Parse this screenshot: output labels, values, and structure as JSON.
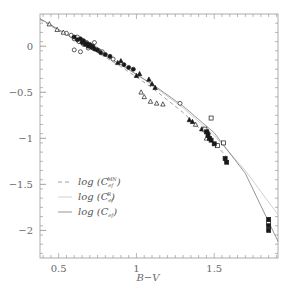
{
  "chart_data": {
    "type": "scatter",
    "title": "",
    "xlabel": "B−V",
    "ylabel": "",
    "xlim": [
      0.38,
      1.91
    ],
    "ylim": [
      -2.3,
      0.35
    ],
    "grid": false,
    "legend_position": "lower left",
    "x_ticks": [
      0.5,
      1,
      1.5
    ],
    "x_tick_labels": [
      "0.5",
      "1",
      "1.5"
    ],
    "y_ticks": [
      0,
      -0.5,
      -1,
      -1.5,
      -2
    ],
    "y_tick_labels": [
      "0",
      "−0.5",
      "−1",
      "−1.5",
      "−2"
    ],
    "legend": [
      {
        "label": "log",
        "symbol": "C",
        "sup": "MN",
        "sub": "ef",
        "style": "dashed",
        "color": "#888888"
      },
      {
        "label": "log",
        "symbol": "C",
        "sup": "R",
        "sub": "ef",
        "style": "solid-light",
        "color": "#c0c0c0"
      },
      {
        "label": "log",
        "symbol": "C",
        "sup": "",
        "sub": "ef",
        "style": "solid",
        "color": "#555555"
      }
    ],
    "series": [
      {
        "name": "log(C_ef^MN)",
        "kind": "line",
        "style": "dashed",
        "x": [
          0.38,
          0.5,
          0.7,
          0.9,
          1.1,
          1.3,
          1.5,
          1.6
        ],
        "y": [
          0.29,
          0.17,
          -0.02,
          -0.22,
          -0.45,
          -0.72,
          -1.05,
          -1.24
        ]
      },
      {
        "name": "log(C_ef^R)",
        "kind": "line",
        "style": "solid-light",
        "x": [
          0.38,
          0.5,
          0.7,
          0.9,
          1.1,
          1.3,
          1.5,
          1.7,
          1.91
        ],
        "y": [
          0.3,
          0.18,
          -0.01,
          -0.2,
          -0.42,
          -0.67,
          -0.97,
          -1.35,
          -1.83
        ]
      },
      {
        "name": "log(C_ef)",
        "kind": "line",
        "style": "solid",
        "x": [
          0.38,
          0.5,
          0.7,
          0.9,
          1.1,
          1.3,
          1.5,
          1.7,
          1.91
        ],
        "y": [
          0.3,
          0.18,
          -0.01,
          -0.2,
          -0.41,
          -0.65,
          -0.94,
          -1.38,
          -2.12
        ]
      },
      {
        "name": "open circles",
        "kind": "points",
        "marker": "circle-open",
        "x": [
          0.55,
          0.58,
          0.6,
          0.62,
          0.63,
          0.65,
          0.66,
          0.68,
          0.7,
          0.72,
          0.74,
          0.76,
          0.78,
          0.6,
          0.64,
          0.69,
          0.73,
          0.85,
          1.28
        ],
        "y": [
          0.14,
          0.12,
          0.08,
          0.1,
          0.05,
          0.06,
          0.02,
          0.04,
          0.0,
          -0.02,
          -0.03,
          -0.05,
          -0.06,
          -0.04,
          -0.06,
          -0.02,
          0.04,
          -0.14,
          -0.62
        ]
      },
      {
        "name": "filled circles",
        "kind": "points",
        "marker": "circle-filled",
        "x": [
          0.6,
          0.62,
          0.64,
          0.65,
          0.66,
          0.67,
          0.68,
          0.69,
          0.7,
          0.71,
          0.72,
          0.73,
          0.75,
          0.77,
          0.8,
          0.83,
          0.92,
          0.95,
          0.98
        ],
        "y": [
          0.1,
          0.07,
          0.08,
          0.04,
          0.06,
          0.02,
          0.03,
          0.0,
          0.02,
          -0.01,
          0.0,
          -0.03,
          -0.04,
          -0.07,
          -0.09,
          -0.11,
          -0.2,
          -0.23,
          -0.25
        ]
      },
      {
        "name": "open triangles",
        "kind": "points",
        "marker": "triangle-open",
        "x": [
          0.44,
          0.49,
          0.53,
          1.03,
          1.05,
          1.09,
          1.13,
          1.17,
          1.38,
          1.45
        ],
        "y": [
          0.24,
          0.18,
          0.15,
          -0.5,
          -0.55,
          -0.6,
          -0.62,
          -0.63,
          -0.85,
          -1.0
        ]
      },
      {
        "name": "filled triangles",
        "kind": "points",
        "marker": "triangle-filled",
        "x": [
          0.88,
          0.9,
          1.0,
          1.02,
          1.08,
          1.1,
          1.12,
          1.34,
          1.36,
          1.42,
          1.46
        ],
        "y": [
          -0.18,
          -0.16,
          -0.32,
          -0.3,
          -0.36,
          -0.41,
          -0.45,
          -0.8,
          -0.82,
          -0.9,
          -0.93
        ]
      },
      {
        "name": "open squares",
        "kind": "points",
        "marker": "square-open",
        "x": [
          1.44,
          1.48,
          1.52,
          1.56,
          1.85
        ],
        "y": [
          -0.9,
          -0.78,
          -1.08,
          -1.05,
          -1.92
        ]
      },
      {
        "name": "filled squares",
        "kind": "points",
        "marker": "square-filled",
        "x": [
          1.45,
          1.46,
          1.47,
          1.48,
          1.5,
          1.57,
          1.58,
          1.85,
          1.85,
          1.85
        ],
        "y": [
          -0.93,
          -0.97,
          -1.0,
          -1.02,
          -1.06,
          -1.22,
          -1.26,
          -1.88,
          -1.95,
          -2.0
        ]
      }
    ]
  }
}
